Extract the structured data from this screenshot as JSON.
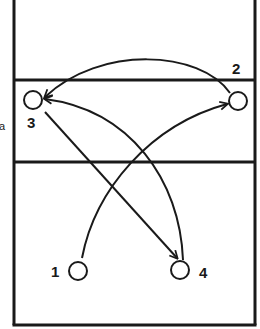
{
  "diagram": {
    "colors": {
      "ink": "#1a1a1a",
      "background": "#ffffff"
    },
    "court": {
      "left_x": 14,
      "right_x": 255,
      "top_y": 0,
      "bottom_y": 325,
      "lines_y": [
        80,
        162
      ]
    },
    "players": [
      {
        "id": "1",
        "label": "1",
        "cx": 78,
        "cy": 271,
        "label_x": 51,
        "label_y": 277
      },
      {
        "id": "2",
        "label": "2",
        "cx": 238,
        "cy": 101,
        "label_x": 232,
        "label_y": 74
      },
      {
        "id": "3",
        "label": "3",
        "cx": 33,
        "cy": 100,
        "label_x": 27,
        "label_y": 128
      },
      {
        "id": "4",
        "label": "4",
        "cx": 180,
        "cy": 270,
        "label_x": 199,
        "label_y": 278
      }
    ],
    "moves": [
      {
        "from": "2",
        "to": "3",
        "path": "M230,93 C200,50 100,45 45,97"
      },
      {
        "from": "4",
        "to": "3",
        "path": "M183,260 C180,180 130,110 45,99"
      },
      {
        "from": "3",
        "to": "4",
        "path": "M45,112 L177,258"
      },
      {
        "from": "1",
        "to": "2",
        "path": "M82,258 C95,190 150,125 227,104"
      }
    ],
    "side_mark": "a"
  }
}
